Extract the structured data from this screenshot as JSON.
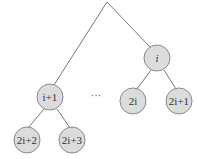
{
  "diagram": {
    "type": "tree",
    "nodes": [
      {
        "id": "i",
        "label": "i",
        "italic_parts": "i"
      },
      {
        "id": "2i",
        "label": "2i"
      },
      {
        "id": "2i+1",
        "label": "2i+1"
      },
      {
        "id": "i+1",
        "label": "i+1"
      },
      {
        "id": "2i+2",
        "label": "2i+2"
      },
      {
        "id": "2i+3",
        "label": "2i+3"
      }
    ],
    "ellipsis": "···",
    "colors": {
      "node_fill": "#dcdcdc",
      "node_stroke": "#8a8a8a",
      "edge": "#777777"
    }
  }
}
